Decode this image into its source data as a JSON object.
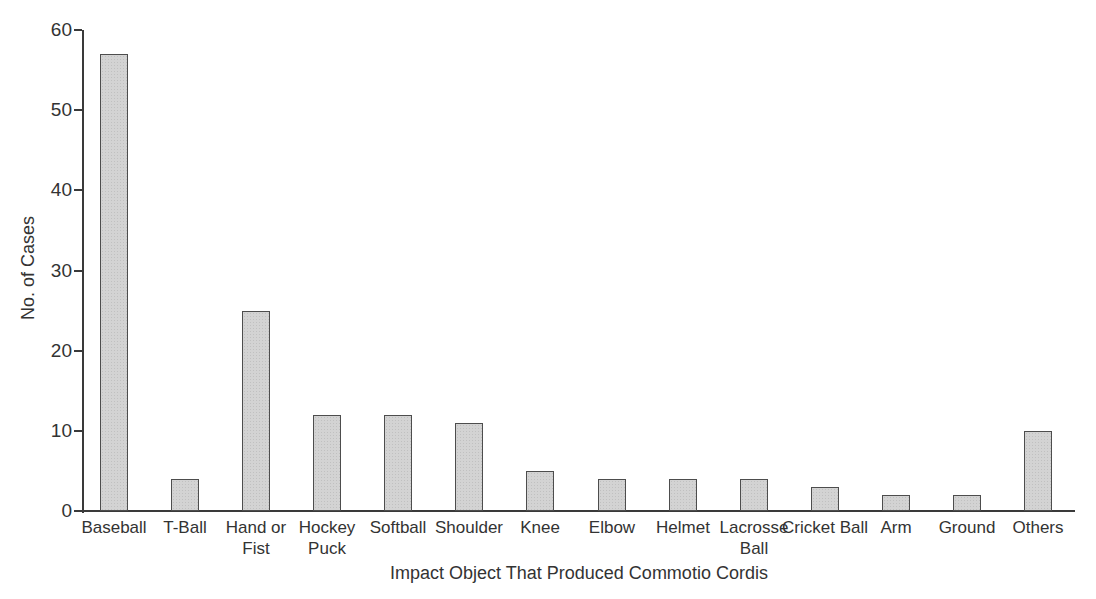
{
  "chart_data": {
    "type": "bar",
    "title": "",
    "categories": [
      "Baseball",
      "T-Ball",
      "Hand or Fist",
      "Hockey Puck",
      "Softball",
      "Shoulder",
      "Knee",
      "Elbow",
      "Helmet",
      "Lacrosse Ball",
      "Cricket Ball",
      "Arm",
      "Ground",
      "Others"
    ],
    "values": [
      57,
      4,
      25,
      12,
      12,
      11,
      5,
      4,
      4,
      4,
      3,
      2,
      2,
      10
    ],
    "xlabel": "Impact Object That Produced Commotio Cordis",
    "ylabel": "No. of Cases",
    "ylim": [
      0,
      60
    ],
    "yticks": [
      0,
      10,
      20,
      30,
      40,
      50,
      60
    ],
    "grid": false,
    "legend": false,
    "colors": {
      "bar_fill": "#d3d3d3",
      "bar_stipple": "#c0c0c0",
      "bar_border": "#4d4d4d",
      "axis": "#3a3a3a",
      "text": "#333333",
      "background": "#ffffff"
    }
  }
}
